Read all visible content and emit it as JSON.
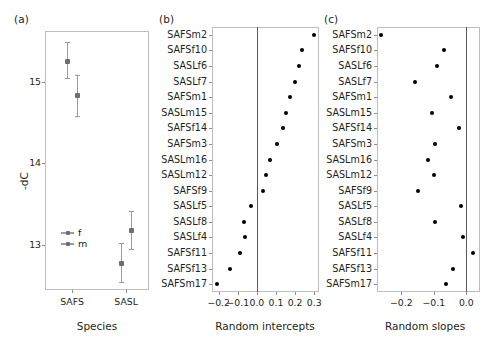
{
  "figure": {
    "panels": [
      {
        "key": "a",
        "label": "(a)"
      },
      {
        "key": "b",
        "label": "(b)"
      },
      {
        "key": "c",
        "label": "(c)"
      }
    ]
  },
  "panel_a": {
    "label": "(a)",
    "xlabel": "Species",
    "ylabel": "-dC",
    "yticks": [
      "13",
      "14",
      "15"
    ],
    "xticks": [
      "SAFS",
      "SASL"
    ],
    "legend": [
      {
        "key": "f",
        "label": "f"
      },
      {
        "key": "m",
        "label": "m"
      }
    ]
  },
  "panel_b": {
    "label": "(b)",
    "xlabel": "Random intercepts",
    "xticks": [
      "-0.2",
      "-0.1",
      "0.0",
      "0.1",
      "0.2",
      "0.3"
    ]
  },
  "panel_c": {
    "label": "(c)",
    "xlabel": "Random slopes",
    "xticks": [
      "-0.2",
      "-0.1",
      "0.0"
    ]
  },
  "categories": [
    "SAFSm2",
    "SAFSf10",
    "SASLf6",
    "SASLf7",
    "SAFSm1",
    "SASLm15",
    "SAFSf14",
    "SAFSm3",
    "SASLm16",
    "SASLm12",
    "SAFSf9",
    "SASLf5",
    "SASLf8",
    "SASLf4",
    "SAFSf11",
    "SAFSf13",
    "SAFSm17"
  ],
  "colors": {
    "point": "#000000",
    "errorbar": "#9a9b9e",
    "point_a": "#6d6e71",
    "axis": "#bcbdc0",
    "zeroline": "#58595b",
    "text": "#231f20"
  },
  "chart_data": [
    {
      "type": "scatter",
      "panel": "a",
      "title": "",
      "xlabel": "Species",
      "ylabel": "-dC",
      "ylim": [
        12.45,
        15.62
      ],
      "xticklabels": [
        "SAFS",
        "SASL"
      ],
      "yticklabels": [
        "13",
        "14",
        "15"
      ],
      "grid": false,
      "legend": [
        "f",
        "m"
      ],
      "legend_position": "inside-lower-left",
      "series": [
        {
          "name": "f",
          "points": [
            {
              "x_category": "SAFS",
              "x": 1,
              "y": 15.25,
              "ci_low": 15.05,
              "ci_high": 15.48
            },
            {
              "x_category": "SASL",
              "x": 2,
              "y": 12.78,
              "ci_low": 12.55,
              "ci_high": 13.02
            }
          ]
        },
        {
          "name": "m",
          "points": [
            {
              "x_category": "SAFS",
              "x": 1,
              "y": 14.83,
              "ci_low": 14.58,
              "ci_high": 15.08
            },
            {
              "x_category": "SASL",
              "x": 2,
              "y": 13.18,
              "ci_low": 12.95,
              "ci_high": 13.42
            }
          ]
        }
      ]
    },
    {
      "type": "scatter",
      "panel": "b",
      "title": "",
      "xlabel": "Random intercepts",
      "ylabel": "",
      "xlim": [
        -0.235,
        0.325
      ],
      "grid": false,
      "reference_line_x": 0.0,
      "xticklabels": [
        "-0.2",
        "-0.1",
        "0.0",
        "0.1",
        "0.2",
        "0.3"
      ],
      "categories": [
        "SAFSm2",
        "SAFSf10",
        "SASLf6",
        "SASLf7",
        "SAFSm1",
        "SASLm15",
        "SAFSf14",
        "SAFSm3",
        "SASLm16",
        "SASLm12",
        "SAFSf9",
        "SASLf5",
        "SASLf8",
        "SASLf4",
        "SAFSf11",
        "SAFSf13",
        "SAFSm17"
      ],
      "values": [
        0.3,
        0.237,
        0.222,
        0.202,
        0.172,
        0.15,
        0.135,
        0.107,
        0.07,
        0.05,
        0.03,
        -0.03,
        -0.07,
        -0.062,
        -0.09,
        -0.14,
        -0.21
      ]
    },
    {
      "type": "scatter",
      "panel": "c",
      "title": "",
      "xlabel": "Random slopes",
      "ylabel": "",
      "xlim": [
        -0.275,
        0.042
      ],
      "grid": false,
      "reference_line_x": 0.0,
      "xticklabels": [
        "-0.2",
        "-0.1",
        "0.0"
      ],
      "categories": [
        "SAFSm2",
        "SAFSf10",
        "SASLf6",
        "SASLf7",
        "SAFSm1",
        "SASLm15",
        "SAFSf14",
        "SAFSm3",
        "SASLm16",
        "SASLm12",
        "SAFSf9",
        "SASLf5",
        "SASLf8",
        "SASLf4",
        "SAFSf11",
        "SAFSf13",
        "SAFSm17"
      ],
      "values": [
        -0.262,
        -0.068,
        -0.09,
        -0.158,
        -0.048,
        -0.105,
        -0.022,
        -0.098,
        -0.118,
        -0.1,
        -0.148,
        -0.017,
        -0.098,
        -0.01,
        0.02,
        -0.04,
        -0.062
      ]
    }
  ]
}
